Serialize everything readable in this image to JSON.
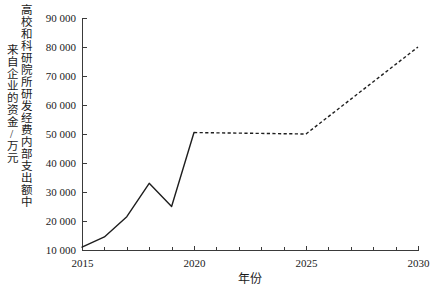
{
  "chart_data": {
    "type": "line",
    "title": "",
    "xlabel": "年份",
    "ylabel": "高校和科研院所研发经费内部支出额中来自企业的资金/万元",
    "ylabel_line1": "高校和科研院所研发经费内部支出额中",
    "ylabel_line2": "来自企业的资金/万元",
    "xlim": [
      2015,
      2030
    ],
    "ylim": [
      10000,
      90000
    ],
    "grid": false,
    "legend": "none",
    "x_ticks": [
      2015,
      2020,
      2025,
      2030
    ],
    "x_tick_labels": [
      "2015",
      "2020",
      "2025",
      "2030"
    ],
    "x_minor_ticks": [
      2016,
      2017,
      2018,
      2019,
      2021,
      2022,
      2023,
      2024,
      2026,
      2027,
      2028,
      2029
    ],
    "y_ticks": [
      10000,
      20000,
      30000,
      40000,
      50000,
      60000,
      70000,
      80000,
      90000
    ],
    "y_tick_labels": [
      "10 000",
      "20 000",
      "30 000",
      "40 000",
      "50 000",
      "60 000",
      "70 000",
      "80 000",
      "90 000"
    ],
    "series": [
      {
        "name": "历史值",
        "style": "solid",
        "x": [
          2015,
          2016,
          2017,
          2018,
          2019,
          2020
        ],
        "values": [
          11000,
          14500,
          21500,
          33000,
          25000,
          50500
        ]
      },
      {
        "name": "预测值",
        "style": "dashed",
        "x": [
          2020,
          2025,
          2030
        ],
        "values": [
          50500,
          50000,
          80000
        ]
      }
    ],
    "line_color": "#1e1e1e",
    "axis_color": "#3a3a3a"
  },
  "caption": {
    "text": ""
  }
}
